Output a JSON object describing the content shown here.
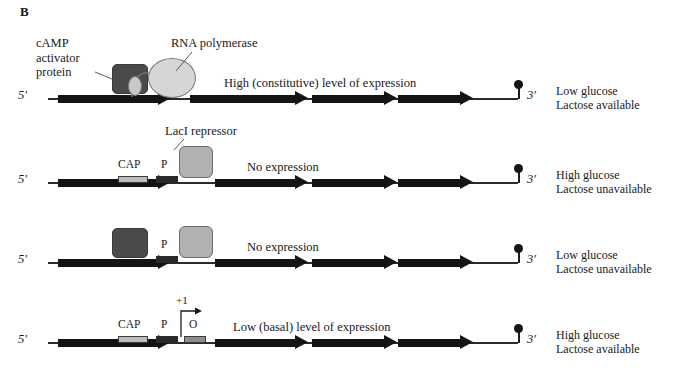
{
  "panel": {
    "letter": "B"
  },
  "labels": {
    "five_prime": "5′",
    "three_prime": "3′",
    "cap_site": "CAP",
    "promoter_site": "P",
    "operator_site": "O",
    "plus_one": "+1",
    "cap_protein": "cAMP\nactivator\nprotein",
    "rna_polymerase": "RNA polymerase",
    "laci_repressor": "LacI repressor"
  },
  "rows": [
    {
      "id": "row-high-constitutive",
      "expression": "High (constitutive) level of expression",
      "state": "Low glucose\nLactose available",
      "cap_bound": true,
      "rnap_bound": true,
      "laci_bound": false,
      "site_labels_visible": false
    },
    {
      "id": "row-no-expression-repressor",
      "expression": "No expression",
      "state": "High glucose\nLactose unavailable",
      "cap_bound": false,
      "rnap_bound": false,
      "laci_bound": true,
      "site_labels_visible": true
    },
    {
      "id": "row-no-expression-cap-repressor",
      "expression": "No expression",
      "state": "Low glucose\nLactose unavailable",
      "cap_bound": true,
      "rnap_bound": false,
      "laci_bound": true,
      "site_labels_visible": false
    },
    {
      "id": "row-low-basal",
      "expression": "Low (basal) level of expression",
      "state": "High glucose\nLactose available",
      "cap_bound": false,
      "rnap_bound": false,
      "laci_bound": false,
      "site_labels_visible": true
    }
  ],
  "colors": {
    "dna": "#2b2b2b",
    "gene_arrow": "#141414",
    "cap_protein": "#4a4a4a",
    "laci_protein": "#b2b2b2",
    "rnap": "#d6d6d6",
    "cap_site": "#bdbdbd",
    "promoter_site": "#2a2a2a",
    "operator_site": "#8d8d8d",
    "background": "#ffffff"
  },
  "geometry": {
    "dna_left": 48,
    "dna_width": 470,
    "lead_arrow": {
      "left": 58,
      "shaft_width": 100
    },
    "genes": [
      {
        "left": 190,
        "shaft_width": 105
      },
      {
        "left": 312,
        "shaft_width": 72
      },
      {
        "left": 398,
        "shaft_width": 62
      }
    ],
    "terminator_left": 514,
    "sites": {
      "cap": {
        "left": 118,
        "width": 30
      },
      "promoter": {
        "left": 156,
        "width": 22
      },
      "operator": {
        "left": 184,
        "width": 22
      }
    }
  }
}
